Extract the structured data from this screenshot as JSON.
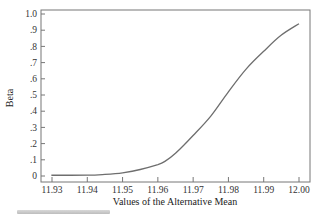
{
  "chart_data": {
    "type": "line",
    "title": "",
    "xlabel": "Values of the Alternative Mean",
    "ylabel": "Beta",
    "xlim": [
      11.93,
      12.0
    ],
    "ylim": [
      0,
      1.0
    ],
    "x_ticks": [
      "11.93",
      "11.94",
      "11.95",
      "11.96",
      "11.97",
      "11.98",
      "11.99",
      "12.00"
    ],
    "y_ticks": [
      "0",
      ".1",
      ".2",
      ".3",
      ".4",
      ".5",
      ".6",
      ".7",
      ".8",
      ".9",
      "1.0"
    ],
    "grid": false,
    "legend": null,
    "series": [
      {
        "name": "Beta",
        "x": [
          11.93,
          11.93,
          11.94,
          11.945,
          11.95,
          11.955,
          11.96,
          11.962,
          11.965,
          11.97,
          11.975,
          11.98,
          11.985,
          11.99,
          11.995,
          12.0
        ],
        "values": [
          0.0,
          0.005,
          0.005,
          0.01,
          0.02,
          0.04,
          0.07,
          0.09,
          0.14,
          0.25,
          0.37,
          0.52,
          0.66,
          0.77,
          0.87,
          0.94
        ]
      }
    ]
  },
  "colors": {
    "line": "#6e6e6e",
    "axis": "#555555"
  }
}
